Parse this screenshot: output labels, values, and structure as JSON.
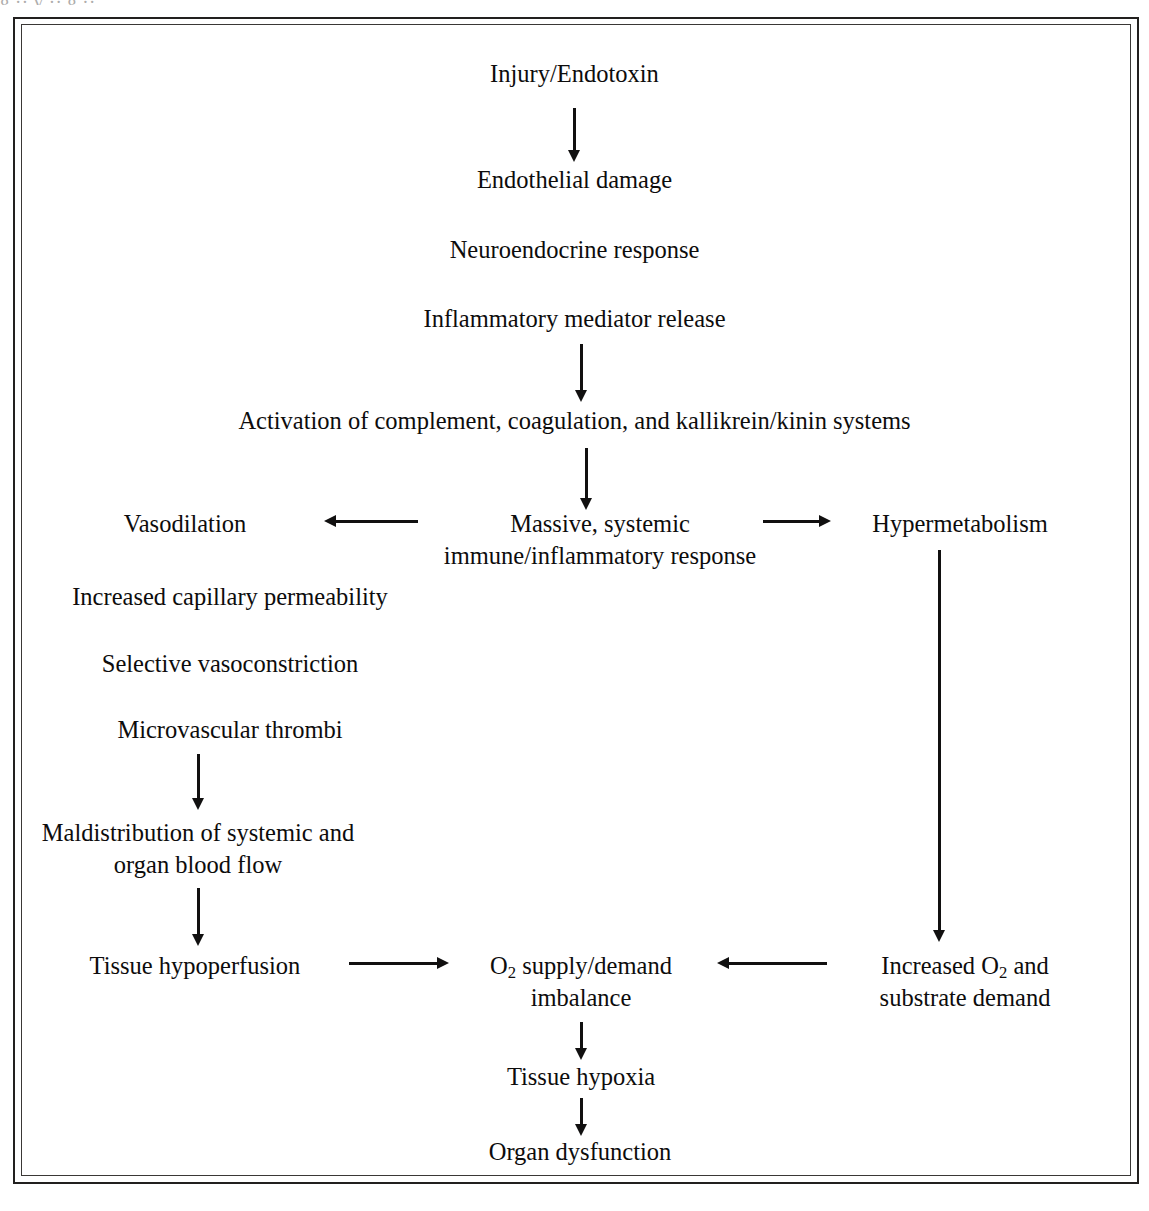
{
  "document": {
    "title": "Pathophysiology of systemic inflammatory response / shock",
    "frame": {
      "style": "double-rule",
      "color": "#22201f"
    },
    "clipped_caption_fragment": "g   ··  y   ··  g   ··"
  },
  "flowchart": {
    "type": "flowchart",
    "orientation": "top-to-bottom",
    "nodes": [
      {
        "id": "injury",
        "label": "Injury/Endotoxin"
      },
      {
        "id": "endothelial",
        "label": "Endothelial damage"
      },
      {
        "id": "neuro",
        "label": "Neuroendocrine response"
      },
      {
        "id": "mediator",
        "label": "Inflammatory mediator release"
      },
      {
        "id": "activation",
        "label": "Activation of complement, coagulation, and kallikrein/kinin systems"
      },
      {
        "id": "massive_l1",
        "label": "Massive, systemic"
      },
      {
        "id": "massive_l2",
        "label": "immune/inflammatory response"
      },
      {
        "id": "vasodilation",
        "label": "Vasodilation"
      },
      {
        "id": "hypermetabolism",
        "label": "Hypermetabolism"
      },
      {
        "id": "capillary",
        "label": "Increased capillary permeability"
      },
      {
        "id": "vasoconstriction",
        "label": "Selective vasoconstriction"
      },
      {
        "id": "thrombi",
        "label": "Microvascular thrombi"
      },
      {
        "id": "maldist_l1",
        "label": "Maldistribution of systemic and"
      },
      {
        "id": "maldist_l2",
        "label": "organ blood flow"
      },
      {
        "id": "hypoperfusion",
        "label": "Tissue hypoperfusion"
      },
      {
        "id": "o2_l1_a",
        "label": "O"
      },
      {
        "id": "o2_l1_sub",
        "label": "2"
      },
      {
        "id": "o2_l1_b",
        "label": " supply/demand"
      },
      {
        "id": "o2_l2",
        "label": "imbalance"
      },
      {
        "id": "incr_o2_a",
        "label": "Increased O"
      },
      {
        "id": "incr_o2_sub",
        "label": "2"
      },
      {
        "id": "incr_o2_b",
        "label": " and"
      },
      {
        "id": "incr_o2_l2",
        "label": "substrate demand"
      },
      {
        "id": "hypoxia",
        "label": "Tissue hypoxia"
      },
      {
        "id": "dysfunction",
        "label": "Organ dysfunction"
      }
    ],
    "edges": [
      {
        "from": "injury",
        "to": "endothelial",
        "direction": "down"
      },
      {
        "from": "mediator",
        "to": "activation",
        "direction": "down"
      },
      {
        "from": "activation",
        "to": "massive",
        "direction": "down"
      },
      {
        "from": "massive",
        "to": "vasodilation",
        "direction": "left"
      },
      {
        "from": "massive",
        "to": "hypermetabolism",
        "direction": "right"
      },
      {
        "from": "thrombi",
        "to": "maldistribution",
        "direction": "down"
      },
      {
        "from": "maldistribution",
        "to": "hypoperfusion",
        "direction": "down"
      },
      {
        "from": "hypermetabolism",
        "to": "increased_o2_demand",
        "direction": "down"
      },
      {
        "from": "hypoperfusion",
        "to": "o2_imbalance",
        "direction": "right"
      },
      {
        "from": "increased_o2_demand",
        "to": "o2_imbalance",
        "direction": "left"
      },
      {
        "from": "o2_imbalance",
        "to": "hypoxia",
        "direction": "down"
      },
      {
        "from": "hypoxia",
        "to": "dysfunction",
        "direction": "down"
      }
    ]
  }
}
